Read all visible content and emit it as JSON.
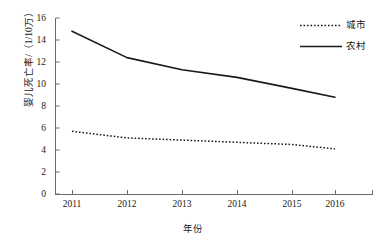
{
  "chart_data": {
    "type": "line",
    "title": "",
    "xlabel": "年份",
    "ylabel": "婴儿死亡率/（1/10万）",
    "categories": [
      "2011",
      "2012",
      "2013",
      "2014",
      "2015",
      "2016"
    ],
    "series": [
      {
        "name": "城市",
        "style": "dotted",
        "color": "#1a1a1a",
        "values": [
          5.7,
          5.1,
          4.9,
          4.7,
          4.5,
          4.1
        ]
      },
      {
        "name": "农村",
        "style": "solid",
        "color": "#1a1a1a",
        "values": [
          14.8,
          12.4,
          11.3,
          10.6,
          9.6,
          8.8
        ]
      }
    ],
    "ylim": [
      0,
      16
    ],
    "ytick_values": [
      "0",
      "2",
      "4",
      "6",
      "8",
      "10",
      "12",
      "14",
      "16"
    ],
    "ytick_step": 2,
    "xtick_labels": [
      "2011",
      "2012",
      "2013",
      "2014",
      "2015",
      "2016"
    ],
    "grid": false,
    "legend_position": "top-right",
    "background_color": "#ffffff",
    "axis_color": "#555555"
  },
  "legend": {
    "entries": [
      {
        "label": "城市",
        "marker": "dotted-line-swatch"
      },
      {
        "label": "农村",
        "marker": "solid-line-swatch"
      }
    ]
  },
  "axes": {
    "y_title": "婴儿死亡率/（1/10万）",
    "x_title": "年份",
    "y_ticks": [
      "16",
      "14",
      "12",
      "10",
      "8",
      "6",
      "4",
      "2",
      "0"
    ],
    "x_ticks": [
      "2011",
      "2012",
      "2013",
      "2014",
      "2015",
      "2016"
    ]
  }
}
